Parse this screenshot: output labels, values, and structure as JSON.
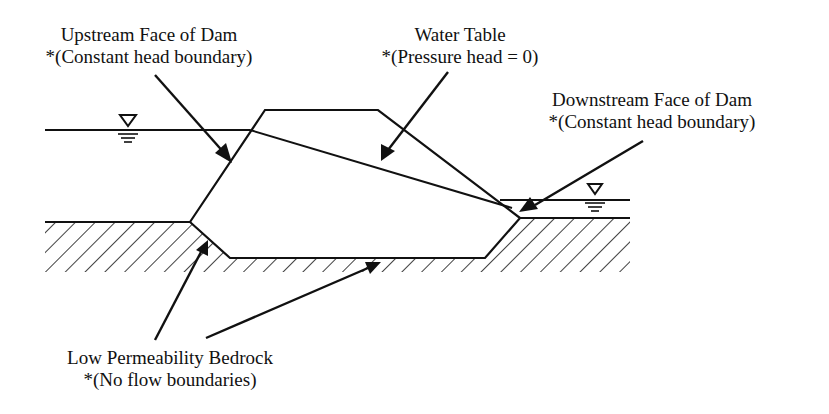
{
  "labels": {
    "upstream_face": {
      "title": "Upstream Face of Dam",
      "note": "*(Constant head boundary)"
    },
    "water_table": {
      "title": "Water Table",
      "note": "*(Pressure head = 0)"
    },
    "downstream_face": {
      "title": "Downstream Face of Dam",
      "note": "*(Constant head boundary)"
    },
    "bedrock": {
      "title": "Low Permeability Bedrock",
      "note": "*(No flow boundaries)"
    }
  },
  "symbols": {
    "water_level_symbol": "▽"
  },
  "colors": {
    "line": "#111111",
    "background": "#ffffff"
  }
}
